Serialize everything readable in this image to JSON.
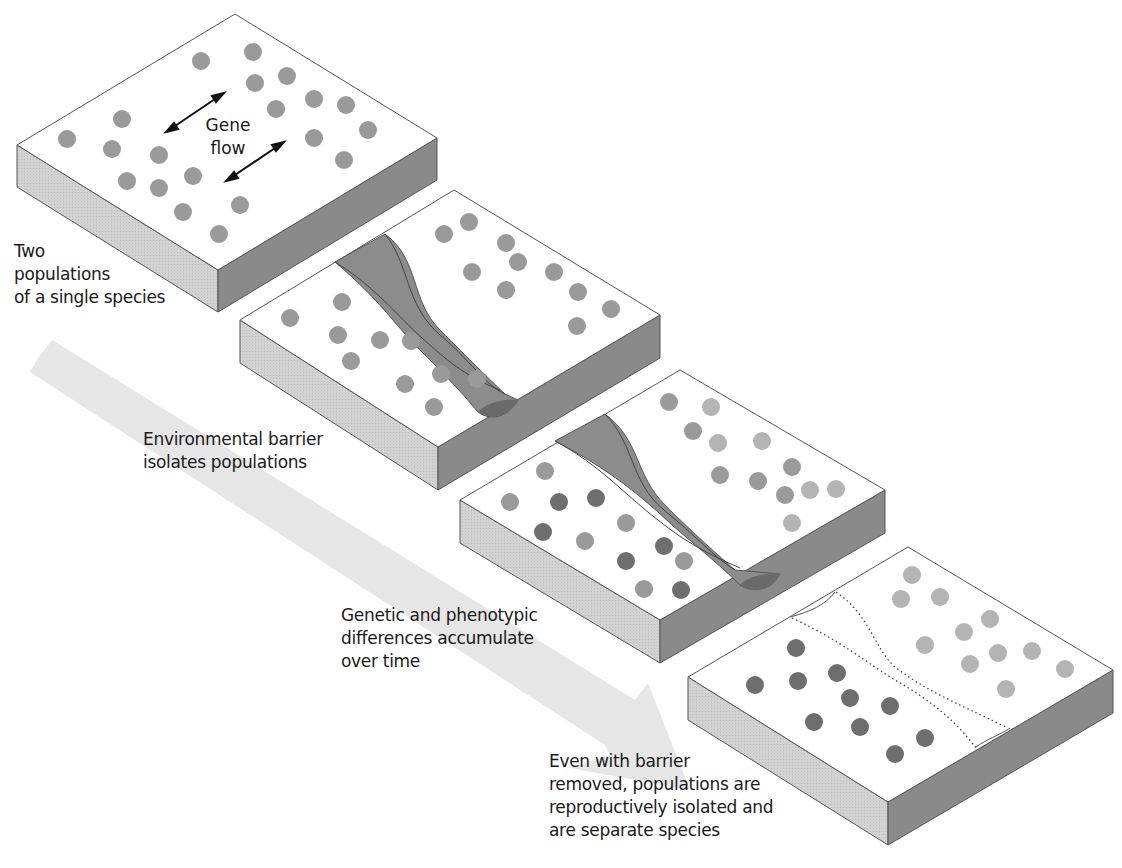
{
  "colors": {
    "background": "#ffffff",
    "top_face": "#ffffff",
    "left_face": "#d4d4d4",
    "right_face": "#8a8a8a",
    "edge": "#555555",
    "barrier": "#8c8c8c",
    "barrier_end": "#6a6a6a",
    "time_arrow": "#e4e4e4",
    "dot_original": "#9a9a9a",
    "dot_light": "#b4b4b4",
    "dot_dark": "#6e6e6e"
  },
  "labels": {
    "gene_flow": "Gene\nflow",
    "stage1": "Two\npopulations\nof a single species",
    "stage2": "Environmental barrier\nisolates populations",
    "stage3": "Genetic and phenotypic\ndifferences accumulate\nover time",
    "stage4": "Even with barrier\nremoved, populations are\nreproductively isolated and\nare separate species"
  },
  "stages": [
    {
      "name": "single-species",
      "barrier": "none"
    },
    {
      "name": "barrier-forms",
      "barrier": "river"
    },
    {
      "name": "divergence",
      "barrier": "river"
    },
    {
      "name": "barrier-removed",
      "barrier": "dotted-trace"
    }
  ]
}
